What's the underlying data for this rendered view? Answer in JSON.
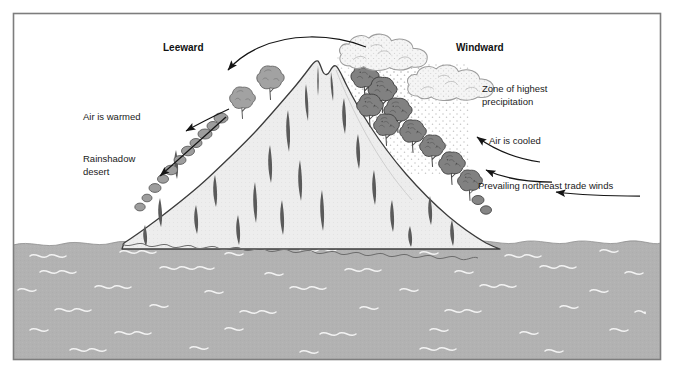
{
  "figure": {
    "frame": {
      "border_color": "#808080",
      "background": "#ffffff"
    }
  },
  "labels": {
    "leeward": "Leeward",
    "windward": "Windward",
    "air_is_warmed": "Air is warmed",
    "rainshadow_desert_line1": "Rainshadow",
    "rainshadow_desert_line2": "desert",
    "zone_line1": "Zone of highest",
    "zone_line2": "precipitation",
    "air_is_cooled": "Air is cooled",
    "trade_winds": "Prevailing northeast trade winds"
  },
  "colors": {
    "ocean": "#b0b0b0",
    "ocean_wave": "#f2f2f2",
    "mountain_fill": "#ececec",
    "mountain_outline": "#3a3a3a",
    "crevice": "#555555",
    "tree_leeward": "#9a9a9a",
    "tree_windward": "#808080",
    "tree_outline": "#4a4a4a",
    "cloud_fill": "#f4f4f4",
    "cloud_outline": "#9a9a9a",
    "rain_dot": "#bcbcbc",
    "arrow": "#1a1a1a",
    "text": "#1a1a1a"
  },
  "elements": {
    "ocean_name": "ocean-water",
    "mountain_name": "mountain",
    "cloud_count": 2,
    "arrow_count": 5
  }
}
